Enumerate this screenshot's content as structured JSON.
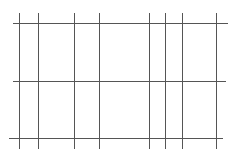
{
  "diagram": {
    "type": "grid-lines",
    "line_color": "#555555",
    "horizontal_lines": [
      {
        "y": 23,
        "x1": 13,
        "x2": 228
      },
      {
        "y": 81,
        "x1": 13,
        "x2": 226
      },
      {
        "y": 138,
        "x1": 9,
        "x2": 223
      }
    ],
    "vertical_lines": [
      {
        "x": 19,
        "y1": 13,
        "y2": 149
      },
      {
        "x": 38,
        "y1": 13,
        "y2": 149
      },
      {
        "x": 74,
        "y1": 13,
        "y2": 149
      },
      {
        "x": 99,
        "y1": 13,
        "y2": 149
      },
      {
        "x": 149,
        "y1": 13,
        "y2": 149
      },
      {
        "x": 165,
        "y1": 13,
        "y2": 149
      },
      {
        "x": 182,
        "y1": 13,
        "y2": 149
      },
      {
        "x": 216,
        "y1": 13,
        "y2": 149
      }
    ]
  }
}
